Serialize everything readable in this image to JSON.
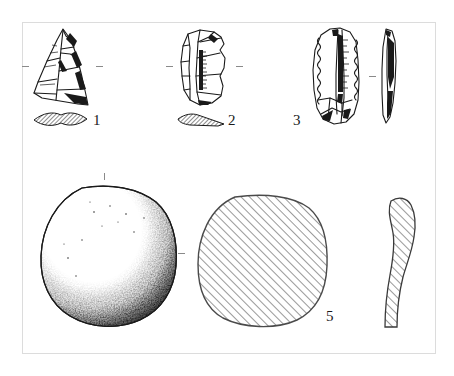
{
  "plate": {
    "kind": "archaeological-artifact-plate",
    "title": "",
    "background_color": "#ffffff",
    "frame_color": "#dcdcdc",
    "ink_color": "#1a1a1a",
    "frame": {
      "x": 22,
      "y": 22,
      "width": 414,
      "height": 332
    }
  },
  "figures": [
    {
      "id": "fig-1",
      "label": "1",
      "label_x": 93,
      "label_y": 115,
      "name": "triangular-point",
      "description": "triangular flaked stone point, dorsal view with flake scars",
      "view": "plan",
      "x": 30,
      "y": 27,
      "width": 62,
      "height": 78
    },
    {
      "id": "fig-1-section",
      "label": "",
      "name": "triangular-point-section",
      "description": "lenticular cross-section, hatched",
      "view": "section",
      "x": 33,
      "y": 112,
      "width": 52,
      "height": 14
    },
    {
      "id": "fig-2",
      "label": "2",
      "label_x": 228,
      "label_y": 115,
      "name": "rectangular-flake",
      "description": "sub-rectangular retouched flake, dorsal view",
      "view": "plan",
      "x": 176,
      "y": 28,
      "width": 55,
      "height": 78
    },
    {
      "id": "fig-2-section",
      "label": "",
      "name": "rectangular-flake-section",
      "description": "wedge-shaped cross-section, hatched",
      "view": "section",
      "x": 176,
      "y": 114,
      "width": 48,
      "height": 13
    },
    {
      "id": "fig-3",
      "label": "3",
      "label_x": 293,
      "label_y": 115,
      "name": "retouched-blade",
      "description": "elongated blade with denticulate retouched edges, face view",
      "view": "plan",
      "x": 310,
      "y": 27,
      "width": 56,
      "height": 100
    },
    {
      "id": "fig-3-profile",
      "label": "",
      "name": "retouched-blade-profile",
      "description": "narrow side profile of the blade",
      "view": "profile",
      "x": 380,
      "y": 28,
      "width": 20,
      "height": 96
    },
    {
      "id": "fig-4",
      "label": "",
      "name": "rounded-grinding-stone",
      "description": "large rounded squarish stone, stippled shading heavier at lower right",
      "view": "plan",
      "x": 40,
      "y": 186,
      "width": 136,
      "height": 140
    },
    {
      "id": "fig-5",
      "label": "5",
      "label_x": 326,
      "label_y": 310,
      "name": "stone-cross-section",
      "description": "rounded square cross-section with diagonal hatching",
      "view": "section",
      "x": 196,
      "y": 195,
      "width": 132,
      "height": 130
    },
    {
      "id": "fig-5-profile",
      "label": "",
      "name": "stone-profile-section",
      "description": "curved elongated hatched profile section",
      "view": "profile",
      "x": 381,
      "y": 197,
      "width": 36,
      "height": 133
    }
  ],
  "ticks": [
    {
      "name": "tick-above-stone",
      "orientation": "v",
      "x": 104,
      "y": 173
    },
    {
      "name": "tick-between-stone-and-section",
      "orientation": "h",
      "x": 178,
      "y": 253
    },
    {
      "name": "tick-left-of-point",
      "orientation": "h",
      "x": 22,
      "y": 66
    },
    {
      "name": "tick-right-of-point",
      "orientation": "h",
      "x": 96,
      "y": 66
    },
    {
      "name": "tick-left-of-flake",
      "orientation": "h",
      "x": 166,
      "y": 66
    },
    {
      "name": "tick-right-of-flake",
      "orientation": "h",
      "x": 236,
      "y": 66
    },
    {
      "name": "tick-between-blade-views",
      "orientation": "h",
      "x": 369,
      "y": 76
    }
  ]
}
